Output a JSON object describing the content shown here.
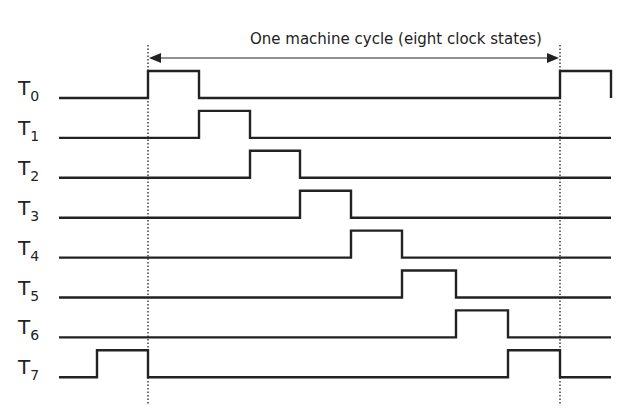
{
  "diagram": {
    "title": "One machine cycle (eight clock states)",
    "type": "timing-diagram",
    "colors": {
      "line": "#222222",
      "background": "#ffffff"
    },
    "time_edges_px": [
      97,
      148,
      199,
      250,
      300,
      351,
      402,
      456,
      508,
      560,
      611
    ],
    "signals": [
      {
        "name": "T",
        "sub": "0",
        "high_intervals": [
          [
            1,
            2
          ],
          [
            9,
            10
          ]
        ]
      },
      {
        "name": "T",
        "sub": "1",
        "high_intervals": [
          [
            2,
            3
          ]
        ]
      },
      {
        "name": "T",
        "sub": "2",
        "high_intervals": [
          [
            3,
            4
          ]
        ]
      },
      {
        "name": "T",
        "sub": "3",
        "high_intervals": [
          [
            4,
            5
          ]
        ]
      },
      {
        "name": "T",
        "sub": "4",
        "high_intervals": [
          [
            5,
            6
          ]
        ]
      },
      {
        "name": "T",
        "sub": "5",
        "high_intervals": [
          [
            6,
            7
          ]
        ]
      },
      {
        "name": "T",
        "sub": "6",
        "high_intervals": [
          [
            7,
            8
          ]
        ]
      },
      {
        "name": "T",
        "sub": "7",
        "high_intervals": [
          [
            0,
            1
          ],
          [
            8,
            9
          ]
        ]
      }
    ],
    "cycle_markers": {
      "start_edge": 1,
      "end_edge": 9,
      "style": "dotted"
    }
  }
}
